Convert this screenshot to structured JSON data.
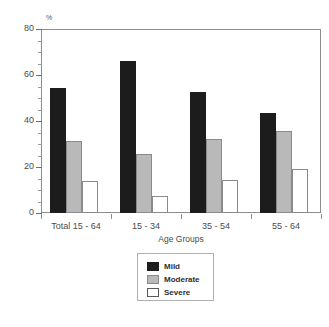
{
  "title_sliver": "",
  "chart_data": {
    "type": "bar",
    "title": "",
    "subtitle": "",
    "xlabel": "Age Groups",
    "ylabel": "%",
    "y_unit_label": "%",
    "categories": [
      "Total 15 - 64",
      "15 - 34",
      "35 - 54",
      "55 - 64"
    ],
    "series": [
      {
        "name": "Mild",
        "color": "#1c1c1c",
        "values": [
          54.3,
          66.0,
          52.7,
          43.6
        ]
      },
      {
        "name": "Moderate",
        "color": "#b9b9b9",
        "values": [
          31.3,
          25.5,
          32.0,
          35.7
        ]
      },
      {
        "name": "Severe",
        "color": "#ffffff",
        "values": [
          14.0,
          7.5,
          14.5,
          19.0
        ]
      }
    ],
    "ylim": [
      0,
      80
    ],
    "y_major_ticks": [
      0,
      20,
      40,
      60,
      80
    ],
    "y_tick_labels": [
      "0",
      "20",
      "40",
      "60",
      "80"
    ],
    "y_minor_tick_step": 5,
    "grid": false,
    "legend_position": "bottom-center",
    "legend_entries": [
      "Mild",
      "Moderate",
      "Severe"
    ]
  }
}
